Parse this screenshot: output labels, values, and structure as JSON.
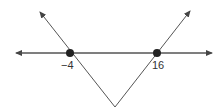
{
  "diagram": {
    "type": "absolute-value-graph-with-number-line",
    "points": [
      {
        "label": "−4",
        "value": -4
      },
      {
        "label": "16",
        "value": 16
      }
    ],
    "colors": {
      "line": "#444444",
      "dot": "#222222",
      "background": "#ffffff"
    }
  }
}
